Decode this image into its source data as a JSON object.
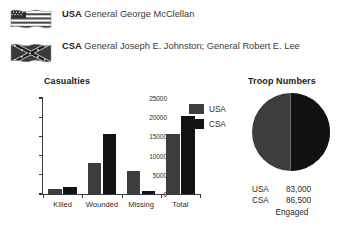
{
  "commanders": [
    {
      "side": "USA",
      "flag_icon": "usa-flag-icon",
      "generals": "General George McClellan"
    },
    {
      "side": "CSA",
      "flag_icon": "csa-battle-flag-icon",
      "generals": "General Joseph E. Johnston; General Robert E. Lee"
    }
  ],
  "casualties_panel": {
    "title": "Casualties",
    "legend": [
      {
        "label": "USA",
        "color": "#3d3d3d"
      },
      {
        "label": "CSA",
        "color": "#121212"
      }
    ]
  },
  "troop_panel": {
    "title": "Troop Numbers",
    "rows": [
      {
        "side": "USA",
        "value": "83,000"
      },
      {
        "side": "CSA",
        "value": "86,500"
      }
    ],
    "footer": "Engaged"
  },
  "chart_data": [
    {
      "type": "bar",
      "title": "Casualties",
      "categories": [
        "Killed",
        "Wounded",
        "Missing",
        "Total"
      ],
      "series": [
        {
          "name": "USA",
          "color": "#3d3d3d",
          "values": [
            1300,
            8000,
            6000,
            15600
          ]
        },
        {
          "name": "CSA",
          "color": "#121212",
          "values": [
            1750,
            15600,
            800,
            20300
          ]
        }
      ],
      "xlabel": "",
      "ylabel": "",
      "ylim": [
        0,
        25000
      ],
      "yticks": [
        0,
        5000,
        10000,
        15000,
        20000,
        25000
      ],
      "ytick_labels": [
        "0",
        "5000",
        "10000",
        "15000",
        "20000",
        "25000"
      ],
      "grid": false,
      "legend_position": "right"
    },
    {
      "type": "pie",
      "title": "Troop Numbers",
      "labels": [
        "USA",
        "CSA"
      ],
      "values": [
        83000,
        86500
      ],
      "value_labels": [
        "83,000",
        "86,500"
      ],
      "colors": [
        "#3d3d3d",
        "#111111"
      ],
      "annotation": "Engaged",
      "legend_position": "below"
    }
  ]
}
